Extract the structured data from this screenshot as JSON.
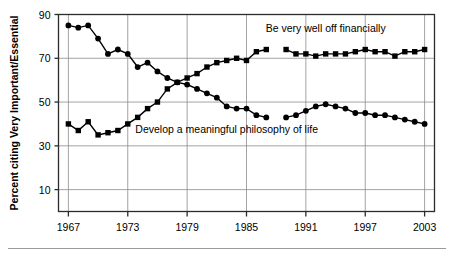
{
  "chart_data": {
    "type": "line",
    "title": "",
    "xlabel": "",
    "ylabel": "Percent citing Very Important/Essential",
    "xlim": [
      1966,
      2004
    ],
    "ylim": [
      0,
      90
    ],
    "yticks": [
      10,
      30,
      50,
      70,
      90
    ],
    "xticks": [
      1967,
      1973,
      1979,
      1985,
      1991,
      1997,
      2003
    ],
    "grid": true,
    "legend_position": "inline-annotation",
    "series": [
      {
        "name": "Be very well off financially",
        "marker": "square",
        "color": "#000000",
        "annotation": "Be very well off financially",
        "annotation_x": 1993,
        "annotation_y": 82,
        "x": [
          1967,
          1968,
          1969,
          1970,
          1971,
          1972,
          1973,
          1974,
          1975,
          1976,
          1977,
          1978,
          1979,
          1980,
          1981,
          1982,
          1983,
          1984,
          1985,
          1986,
          1987,
          1989,
          1990,
          1991,
          1992,
          1993,
          1994,
          1995,
          1996,
          1997,
          1998,
          1999,
          2000,
          2001,
          2002,
          2003
        ],
        "y": [
          40,
          37,
          41,
          35,
          36,
          37,
          40,
          43,
          47,
          50,
          56,
          59,
          61,
          63,
          66,
          68,
          69,
          70,
          69,
          73,
          74,
          74,
          72,
          72,
          71,
          72,
          72,
          72,
          73,
          74,
          73,
          73,
          71,
          73,
          73,
          74
        ]
      },
      {
        "name": "Develop a meaningful philosophy of life",
        "marker": "circle",
        "color": "#000000",
        "annotation": "Develop a meaningful philosophy of life",
        "annotation_x": 1983,
        "annotation_y": 36,
        "x": [
          1967,
          1968,
          1969,
          1970,
          1971,
          1972,
          1973,
          1974,
          1975,
          1976,
          1977,
          1978,
          1979,
          1980,
          1981,
          1982,
          1983,
          1984,
          1985,
          1986,
          1987,
          1989,
          1990,
          1991,
          1992,
          1993,
          1994,
          1995,
          1996,
          1997,
          1998,
          1999,
          2000,
          2001,
          2002,
          2003
        ],
        "y": [
          85,
          84,
          85,
          79,
          72,
          74,
          72,
          66,
          68,
          64,
          61,
          59,
          58,
          56,
          54,
          52,
          48,
          47,
          47,
          44,
          43,
          43,
          44,
          46,
          48,
          49,
          48,
          47,
          45,
          45,
          44,
          44,
          43,
          42,
          41,
          40
        ]
      }
    ]
  }
}
